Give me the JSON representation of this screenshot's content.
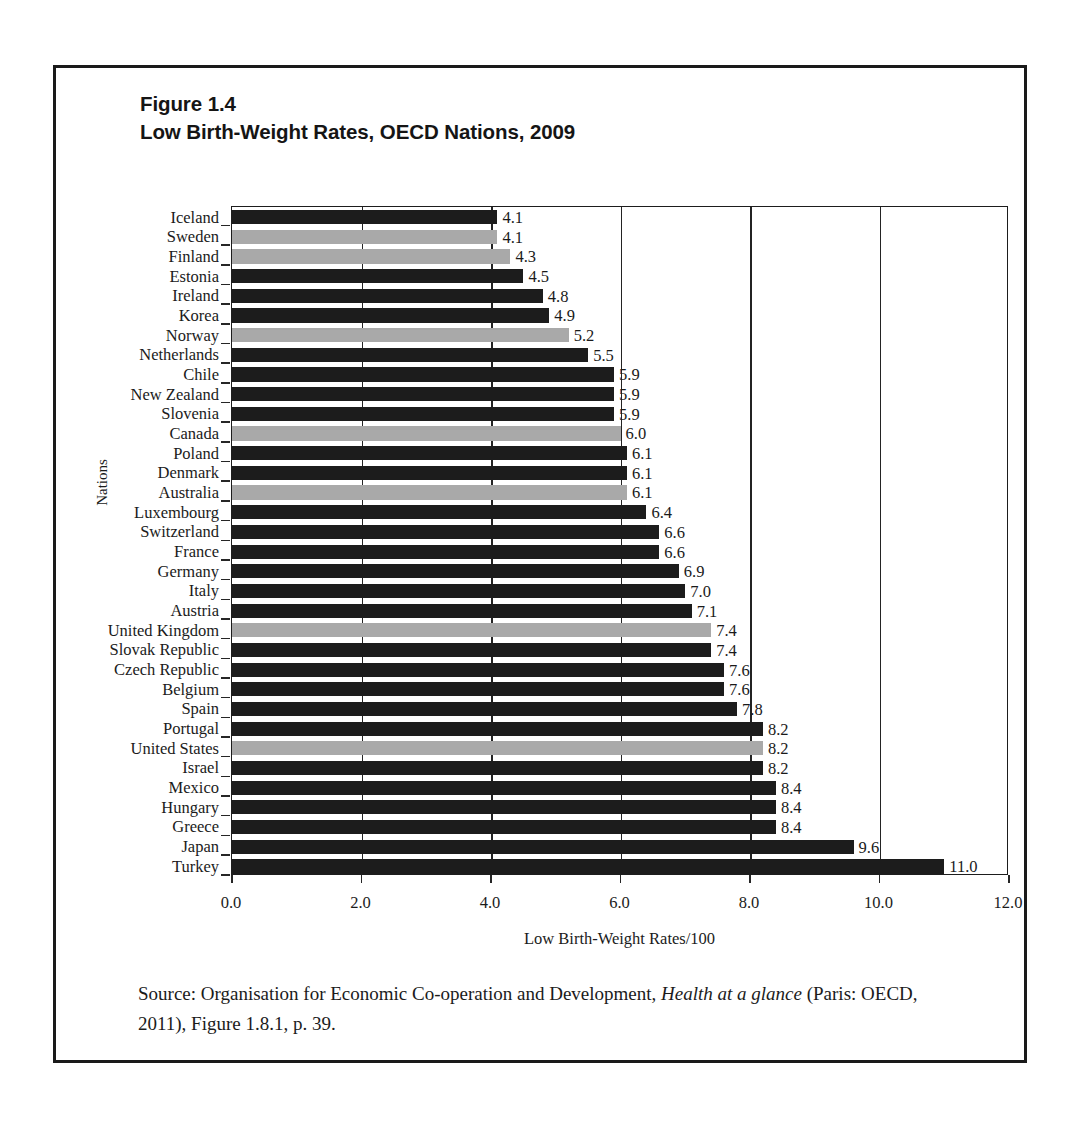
{
  "figure": {
    "number_line": "Figure 1.4",
    "title_line": "Low Birth-Weight Rates, OECD Nations, 2009",
    "source_prefix": "Source: Organisation for Economic Co-operation and Development, ",
    "source_italic": "Health at a glance",
    "source_suffix": " (Paris: OECD, 2011), Figure 1.8.1, p. 39."
  },
  "colors": {
    "bar_dark": "#1c1c1c",
    "bar_gray": "#a9a9a9",
    "axis": "#1d1d1d",
    "text": "#1b1b1b",
    "frame": "#1a1a1a"
  },
  "chart_data": {
    "type": "bar",
    "orientation": "horizontal",
    "title": "Low Birth-Weight Rates, OECD Nations, 2009",
    "xlabel": "Low Birth-Weight Rates/100",
    "ylabel": "Nations",
    "xlim": [
      0.0,
      12.0
    ],
    "xticks": [
      "0.0",
      "2.0",
      "4.0",
      "6.0",
      "8.0",
      "10.0",
      "12.0"
    ],
    "xtick_values": [
      0.0,
      2.0,
      4.0,
      6.0,
      8.0,
      10.0,
      12.0
    ],
    "grid": "vertical-major",
    "legend": "none",
    "categories": [
      "Iceland",
      "Sweden",
      "Finland",
      "Estonia",
      "Ireland",
      "Korea",
      "Norway",
      "Netherlands",
      "Chile",
      "New Zealand",
      "Slovenia",
      "Canada",
      "Poland",
      "Denmark",
      "Australia",
      "Luxembourg",
      "Switzerland",
      "France",
      "Germany",
      "Italy",
      "Austria",
      "United Kingdom",
      "Slovak Republic",
      "Czech Republic",
      "Belgium",
      "Spain",
      "Portugal",
      "United States",
      "Israel",
      "Mexico",
      "Hungary",
      "Greece",
      "Japan",
      "Turkey"
    ],
    "values": [
      4.1,
      4.1,
      4.3,
      4.5,
      4.8,
      4.9,
      5.2,
      5.5,
      5.9,
      5.9,
      5.9,
      6.0,
      6.1,
      6.1,
      6.1,
      6.4,
      6.6,
      6.6,
      6.9,
      7.0,
      7.1,
      7.4,
      7.4,
      7.6,
      7.6,
      7.8,
      8.2,
      8.2,
      8.2,
      8.4,
      8.4,
      8.4,
      9.6,
      11.0
    ],
    "value_labels": [
      "4.1",
      "4.1",
      "4.3",
      "4.5",
      "4.8",
      "4.9",
      "5.2",
      "5.5",
      "5.9",
      "5.9",
      "5.9",
      "6.0",
      "6.1",
      "6.1",
      "6.1",
      "6.4",
      "6.6",
      "6.6",
      "6.9",
      "7.0",
      "7.1",
      "7.4",
      "7.4",
      "7.6",
      "7.6",
      "7.8",
      "8.2",
      "8.2",
      "8.2",
      "8.4",
      "8.4",
      "8.4",
      "9.6",
      "11.0"
    ],
    "bar_styles": [
      "dark",
      "gray",
      "gray",
      "dark",
      "dark",
      "dark",
      "gray",
      "dark",
      "dark",
      "dark",
      "dark",
      "gray",
      "dark",
      "dark",
      "gray",
      "dark",
      "dark",
      "dark",
      "dark",
      "dark",
      "dark",
      "gray",
      "dark",
      "dark",
      "dark",
      "dark",
      "dark",
      "gray",
      "dark",
      "dark",
      "dark",
      "dark",
      "dark",
      "dark"
    ]
  }
}
